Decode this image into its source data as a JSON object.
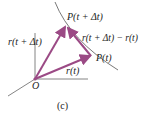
{
  "labels": {
    "p_t_dt": "P(t + Δt)",
    "r_t_dt": "r(t + Δt)",
    "diff": "r(t + Δt) − r(t)",
    "p_t": "P(t)",
    "r_t": "r(t)",
    "origin": "O",
    "caption": "(c)"
  },
  "colors": {
    "vector": "#9b4a85",
    "axis": "#555555"
  }
}
